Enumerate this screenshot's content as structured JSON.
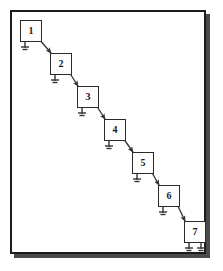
{
  "figure": {
    "type": "cascade-chain-diagram",
    "orientation": "top-left-to-bottom-right",
    "frame": {
      "border_color": "#1c1c1c",
      "shadow_color": "#4a4a4a",
      "background": "#ffffff"
    },
    "nodes": [
      {
        "id": "node-1",
        "label": "1",
        "x": 20,
        "y": 20,
        "ground_count": 1
      },
      {
        "id": "node-2",
        "label": "2",
        "x": 50,
        "y": 53,
        "ground_count": 1
      },
      {
        "id": "node-3",
        "label": "3",
        "x": 77,
        "y": 86,
        "ground_count": 1
      },
      {
        "id": "node-4",
        "label": "4",
        "x": 104,
        "y": 119,
        "ground_count": 1
      },
      {
        "id": "node-5",
        "label": "5",
        "x": 132,
        "y": 152,
        "ground_count": 1
      },
      {
        "id": "node-6",
        "label": "6",
        "x": 158,
        "y": 185,
        "ground_count": 1
      },
      {
        "id": "node-7",
        "label": "7",
        "x": 184,
        "y": 221,
        "ground_count": 2
      }
    ],
    "connections": [
      {
        "from": "node-1",
        "to": "node-2",
        "style": "arrow"
      },
      {
        "from": "node-2",
        "to": "node-3",
        "style": "arrow"
      },
      {
        "from": "node-3",
        "to": "node-4",
        "style": "arrow"
      },
      {
        "from": "node-4",
        "to": "node-5",
        "style": "arrow"
      },
      {
        "from": "node-5",
        "to": "node-6",
        "style": "arrow"
      },
      {
        "from": "node-6",
        "to": "node-7",
        "style": "arrow"
      }
    ],
    "colors": {
      "node_fill": "#fdfdfd",
      "node_stroke": "#2b2b2b",
      "arrow": "#333333",
      "ground": "#333333",
      "label": "#1a1a1a"
    }
  }
}
